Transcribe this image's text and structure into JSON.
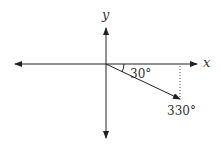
{
  "diagram": {
    "axes": {
      "x_label": "x",
      "y_label": "y"
    },
    "angles": {
      "reference_angle": "30°",
      "terminal_angle": "330°"
    },
    "colors": {
      "line": "#222222",
      "text": "#333333"
    }
  }
}
